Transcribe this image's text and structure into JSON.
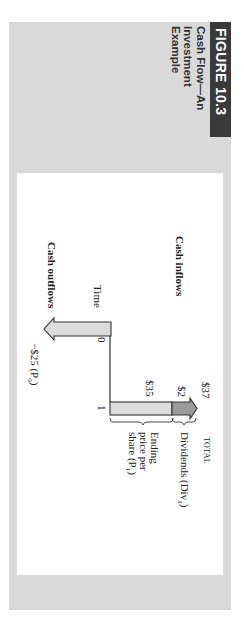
{
  "figure": {
    "label": "FIGURE 10.3",
    "title_lines": [
      "Cash Flow—An",
      "Investment",
      "Example"
    ]
  },
  "diagram": {
    "cash_inflows_label": "Cash inflows",
    "cash_outflows_label": "Cash outflows",
    "time_label": "Time",
    "time_ticks": [
      "0",
      "1"
    ],
    "outflow_value": "−$25 (P",
    "outflow_subscript": "0",
    "inflow_total_value": "$37",
    "inflow_total_label": "TOTAL",
    "dividend_value": "$2",
    "dividend_label": "Dividends (Div",
    "dividend_subscript": "1",
    "ending_price_value": "$35",
    "ending_price_lines": [
      "Ending",
      "price per",
      "share (P"
    ],
    "ending_price_subscript": "1",
    "colors": {
      "frame_gray": "#d9d9d9",
      "header_dark": "#3a3a3a",
      "arrow_light": "#dcdcdc",
      "arrow_dark": "#9a9a9a"
    }
  }
}
